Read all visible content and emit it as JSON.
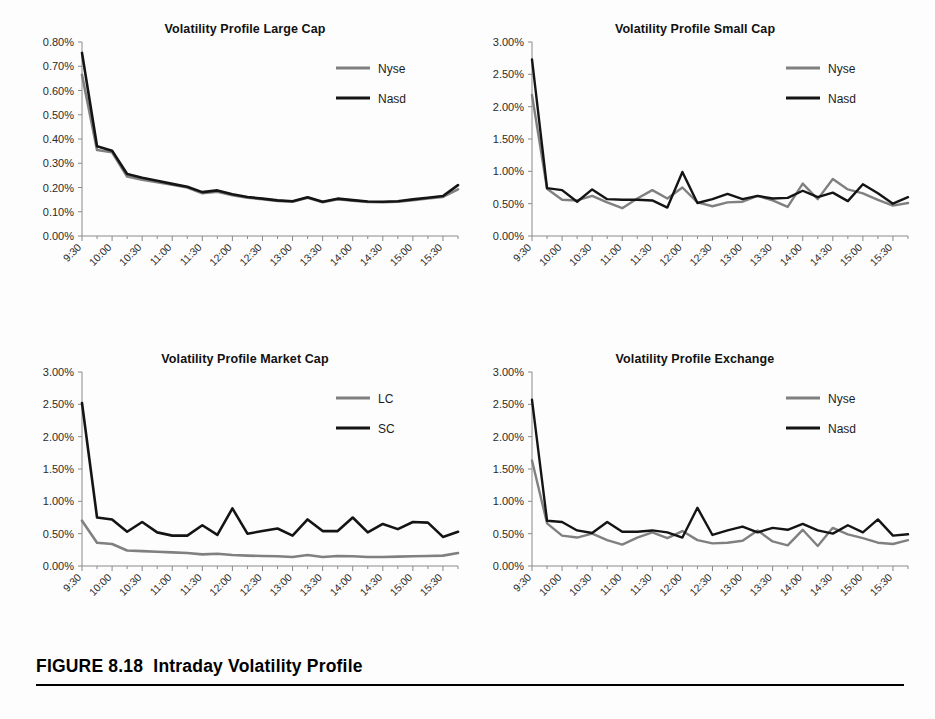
{
  "figure": {
    "caption_label": "FIGURE 8.18",
    "caption_title": "Intraday Volatility Profile",
    "caption_full": "FIGURE 8.18  Intraday Volatility Profile"
  },
  "colors": {
    "series_gray": "#808080",
    "series_black": "#141414",
    "axis": "#8a8a8a",
    "text": "#1a1a1a",
    "background": "#ffffff"
  },
  "shared": {
    "x_tick_labels": [
      "9:30",
      "10:00",
      "10:30",
      "11:00",
      "11:30",
      "12:00",
      "12:30",
      "13:00",
      "13:30",
      "14:00",
      "14:30",
      "15:00",
      "15:30"
    ],
    "x_points": [
      "9:30",
      "9:45",
      "10:00",
      "10:15",
      "10:30",
      "10:45",
      "11:00",
      "11:15",
      "11:30",
      "11:45",
      "12:00",
      "12:15",
      "12:30",
      "12:45",
      "13:00",
      "13:15",
      "13:30",
      "13:45",
      "14:00",
      "14:15",
      "14:30",
      "14:45",
      "15:00",
      "15:15",
      "15:30",
      "15:45"
    ]
  },
  "chart_data": [
    {
      "id": "large-cap",
      "type": "line",
      "title": "Volatility Profile Large Cap",
      "xlabel": "",
      "ylabel": "",
      "ylim": [
        0,
        0.8
      ],
      "ytick_step": 0.1,
      "ytick_labels": [
        "0.00%",
        "0.10%",
        "0.20%",
        "0.30%",
        "0.40%",
        "0.50%",
        "0.60%",
        "0.70%",
        "0.80%"
      ],
      "ytick_values": [
        0,
        0.1,
        0.2,
        0.3,
        0.4,
        0.5,
        0.6,
        0.7,
        0.8
      ],
      "grid": false,
      "legend_position": "top-right",
      "x": [
        "9:30",
        "9:45",
        "10:00",
        "10:15",
        "10:30",
        "10:45",
        "11:00",
        "11:15",
        "11:30",
        "11:45",
        "12:00",
        "12:15",
        "12:30",
        "12:45",
        "13:00",
        "13:15",
        "13:30",
        "13:45",
        "14:00",
        "14:15",
        "14:30",
        "14:45",
        "15:00",
        "15:15",
        "15:30",
        "15:45"
      ],
      "series": [
        {
          "name": "Nyse",
          "color": "#808080",
          "width": 2.6,
          "values": [
            0.665,
            0.355,
            0.345,
            0.245,
            0.232,
            0.222,
            0.211,
            0.2,
            0.176,
            0.183,
            0.168,
            0.158,
            0.152,
            0.145,
            0.141,
            0.158,
            0.139,
            0.152,
            0.146,
            0.14,
            0.139,
            0.141,
            0.148,
            0.155,
            0.161,
            0.192
          ]
        },
        {
          "name": "Nasd",
          "color": "#141414",
          "width": 2.6,
          "values": [
            0.755,
            0.37,
            0.352,
            0.256,
            0.24,
            0.228,
            0.215,
            0.203,
            0.181,
            0.188,
            0.172,
            0.161,
            0.154,
            0.147,
            0.143,
            0.16,
            0.141,
            0.154,
            0.148,
            0.142,
            0.141,
            0.143,
            0.151,
            0.158,
            0.165,
            0.21
          ]
        }
      ]
    },
    {
      "id": "small-cap",
      "type": "line",
      "title": "Volatility Profile Small Cap",
      "xlabel": "",
      "ylabel": "",
      "ylim": [
        0,
        3.0
      ],
      "ytick_step": 0.5,
      "ytick_labels": [
        "0.00%",
        "0.50%",
        "1.00%",
        "1.50%",
        "2.00%",
        "2.50%",
        "3.00%"
      ],
      "ytick_values": [
        0,
        0.5,
        1.0,
        1.5,
        2.0,
        2.5,
        3.0
      ],
      "grid": false,
      "legend_position": "top-right",
      "x": [
        "9:30",
        "9:45",
        "10:00",
        "10:15",
        "10:30",
        "10:45",
        "11:00",
        "11:15",
        "11:30",
        "11:45",
        "12:00",
        "12:15",
        "12:30",
        "12:45",
        "13:00",
        "13:15",
        "13:30",
        "13:45",
        "14:00",
        "14:15",
        "14:30",
        "14:45",
        "15:00",
        "15:15",
        "15:30",
        "15:45"
      ],
      "series": [
        {
          "name": "Nyse",
          "color": "#808080",
          "width": 2.4,
          "values": [
            2.18,
            0.73,
            0.56,
            0.55,
            0.62,
            0.52,
            0.43,
            0.58,
            0.71,
            0.58,
            0.75,
            0.52,
            0.46,
            0.52,
            0.53,
            0.62,
            0.55,
            0.45,
            0.81,
            0.57,
            0.88,
            0.72,
            0.66,
            0.56,
            0.47,
            0.51
          ]
        },
        {
          "name": "Nasd",
          "color": "#141414",
          "width": 2.4,
          "values": [
            2.73,
            0.74,
            0.71,
            0.53,
            0.72,
            0.57,
            0.56,
            0.56,
            0.55,
            0.44,
            0.99,
            0.51,
            0.57,
            0.65,
            0.57,
            0.62,
            0.58,
            0.59,
            0.7,
            0.6,
            0.67,
            0.54,
            0.8,
            0.66,
            0.5,
            0.6
          ]
        }
      ]
    },
    {
      "id": "market-cap",
      "type": "line",
      "title": "Volatility Profile Market Cap",
      "xlabel": "",
      "ylabel": "",
      "ylim": [
        0,
        3.0
      ],
      "ytick_step": 0.5,
      "ytick_labels": [
        "0.00%",
        "0.50%",
        "1.00%",
        "1.50%",
        "2.00%",
        "2.50%",
        "3.00%"
      ],
      "ytick_values": [
        0,
        0.5,
        1.0,
        1.5,
        2.0,
        2.5,
        3.0
      ],
      "grid": false,
      "legend_position": "top-right",
      "x": [
        "9:30",
        "9:45",
        "10:00",
        "10:15",
        "10:30",
        "10:45",
        "11:00",
        "11:15",
        "11:30",
        "11:45",
        "12:00",
        "12:15",
        "12:30",
        "12:45",
        "13:00",
        "13:15",
        "13:30",
        "13:45",
        "14:00",
        "14:15",
        "14:30",
        "14:45",
        "15:00",
        "15:15",
        "15:30",
        "15:45"
      ],
      "series": [
        {
          "name": "LC",
          "color": "#808080",
          "width": 2.6,
          "values": [
            0.7,
            0.36,
            0.34,
            0.24,
            0.23,
            0.22,
            0.21,
            0.2,
            0.18,
            0.19,
            0.17,
            0.16,
            0.155,
            0.15,
            0.14,
            0.17,
            0.14,
            0.155,
            0.15,
            0.14,
            0.14,
            0.145,
            0.15,
            0.155,
            0.16,
            0.2
          ]
        },
        {
          "name": "SC",
          "color": "#141414",
          "width": 2.6,
          "values": [
            2.52,
            0.75,
            0.72,
            0.53,
            0.68,
            0.52,
            0.47,
            0.47,
            0.63,
            0.48,
            0.89,
            0.5,
            0.54,
            0.58,
            0.47,
            0.72,
            0.54,
            0.54,
            0.75,
            0.52,
            0.65,
            0.57,
            0.68,
            0.67,
            0.45,
            0.53
          ]
        }
      ]
    },
    {
      "id": "exchange",
      "type": "line",
      "title": "Volatility Profile Exchange",
      "xlabel": "",
      "ylabel": "",
      "ylim": [
        0,
        3.0
      ],
      "ytick_step": 0.5,
      "ytick_labels": [
        "0.00%",
        "0.50%",
        "1.00%",
        "1.50%",
        "2.00%",
        "2.50%",
        "3.00%"
      ],
      "ytick_values": [
        0,
        0.5,
        1.0,
        1.5,
        2.0,
        2.5,
        3.0
      ],
      "grid": false,
      "legend_position": "top-right",
      "x": [
        "9:30",
        "9:45",
        "10:00",
        "10:15",
        "10:30",
        "10:45",
        "11:00",
        "11:15",
        "11:30",
        "11:45",
        "12:00",
        "12:15",
        "12:30",
        "12:45",
        "13:00",
        "13:15",
        "13:30",
        "13:45",
        "14:00",
        "14:15",
        "14:30",
        "14:45",
        "15:00",
        "15:15",
        "15:30",
        "15:45"
      ],
      "series": [
        {
          "name": "Nyse",
          "color": "#808080",
          "width": 2.4,
          "values": [
            1.63,
            0.66,
            0.47,
            0.44,
            0.5,
            0.4,
            0.33,
            0.44,
            0.52,
            0.43,
            0.54,
            0.4,
            0.35,
            0.36,
            0.39,
            0.55,
            0.38,
            0.32,
            0.56,
            0.31,
            0.59,
            0.49,
            0.43,
            0.36,
            0.34,
            0.4
          ]
        },
        {
          "name": "Nasd",
          "color": "#141414",
          "width": 2.4,
          "values": [
            2.57,
            0.7,
            0.68,
            0.55,
            0.51,
            0.68,
            0.53,
            0.53,
            0.55,
            0.52,
            0.44,
            0.9,
            0.48,
            0.55,
            0.61,
            0.52,
            0.59,
            0.56,
            0.65,
            0.55,
            0.5,
            0.63,
            0.52,
            0.72,
            0.47,
            0.49,
            0.56
          ]
        }
      ]
    }
  ]
}
